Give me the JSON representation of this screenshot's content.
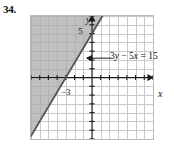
{
  "problem": {
    "number": "34."
  },
  "figure": {
    "axis_x_name": "x",
    "axis_y_name": "y",
    "equation_label": "3y − 5x = 15",
    "equation_parts": {
      "coef_y": "3",
      "var_y": "y",
      "minus": "−",
      "coef_x": "5",
      "var_x": "x",
      "equals": "=",
      "constant": "15"
    },
    "tick_labels": {
      "y_intercept": "5",
      "x_intercept": "−3"
    },
    "colors": {
      "shading": "#a8a8a8",
      "grid": "#c9c9c9",
      "axis": "#1a1a1a",
      "boundary_line": "#555555",
      "border": "#b9b9b9",
      "text": "#111111"
    }
  },
  "chart_data": {
    "type": "line",
    "title": "",
    "subtitle": "",
    "xlabel": "x",
    "ylabel": "y",
    "xlim": [
      -7,
      7
    ],
    "ylim": [
      -7,
      7
    ],
    "grid": true,
    "grid_step": 1,
    "legend": "none",
    "annotations": [
      {
        "text": "3y − 5x = 15",
        "x": 2.2,
        "y": 2.2,
        "arrow_to_x": -0.6,
        "arrow_to_y": 2.2,
        "arrow_direction": "left"
      },
      {
        "text": "5",
        "x": -0.55,
        "y": 5,
        "role": "y-intercept-label"
      },
      {
        "text": "−3",
        "x": -2.6,
        "y": -0.6,
        "role": "x-intercept-label"
      }
    ],
    "series": [
      {
        "name": "3y - 5x = 15",
        "type": "line",
        "style": "solid",
        "slope": 1.6666666667,
        "intercept": 5,
        "x_intercept": -3,
        "y_intercept": 5,
        "points": [
          [
            -7,
            -6.6667
          ],
          [
            -3,
            0
          ],
          [
            0,
            5
          ],
          [
            1.2,
            7
          ]
        ]
      }
    ],
    "shaded_region": {
      "inequality": "3y - 5x >= 15",
      "side": "above-left",
      "boundary": "solid",
      "fill": "#a8a8a8",
      "description": "Region above and to the left of the line 3y - 5x = 15 is shaded gray."
    },
    "axis_ticks": {
      "x": [
        -7,
        -6,
        -5,
        -4,
        -3,
        -2,
        -1,
        0,
        1,
        2,
        3,
        4,
        5,
        6,
        7
      ],
      "y": [
        -7,
        -6,
        -5,
        -4,
        -3,
        -2,
        -1,
        0,
        1,
        2,
        3,
        4,
        5,
        6,
        7
      ],
      "labeled_x": [
        "−3"
      ],
      "labeled_y": [
        "5"
      ]
    }
  }
}
